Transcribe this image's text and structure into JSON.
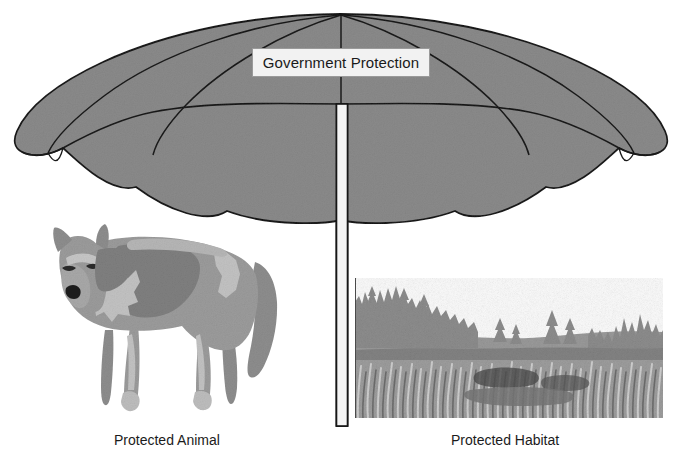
{
  "figure": {
    "domain": "Diagram",
    "background_color": "#ffffff",
    "width": 683,
    "height": 467
  },
  "umbrella": {
    "label": "Government Protection",
    "canopy_color": "#8a8a8a",
    "canopy_outline_color": "#1a1a1a",
    "pole_color": "#f4f4f4",
    "pole_outline_color": "#161616",
    "panel_count": 6
  },
  "animal": {
    "caption": "Protected Animal",
    "species_depicted": "wolf",
    "body_color": "#9b9b9b",
    "shadow_color": "#7a7a7a",
    "highlight_color": "#bcbcbc",
    "nose_color": "#1f1f1f"
  },
  "habitat": {
    "caption": "Protected Habitat",
    "scene_depicted": "conifer forest and meadow",
    "sky_color": "#fbfbfb",
    "treeline_color": "#8d8d8d",
    "ridge_color": "#7f7f7f",
    "meadow_color": "#9d9d9d"
  },
  "footnote": {
    "text": ""
  }
}
